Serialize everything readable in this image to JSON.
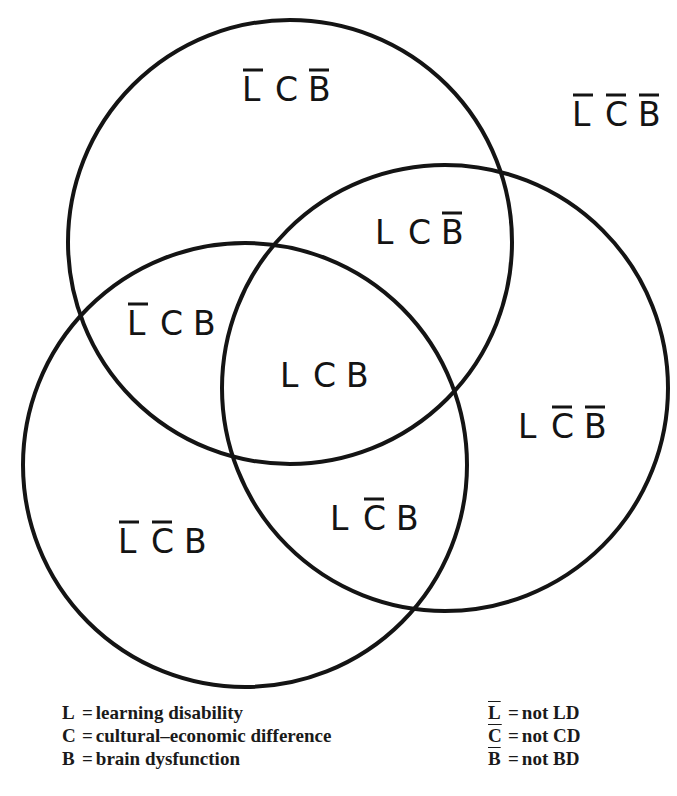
{
  "diagram": {
    "type": "venn",
    "stroke_color": "#141414",
    "background": "#ffffff",
    "circles": [
      {
        "id": "top",
        "cx": 290,
        "cy": 242,
        "r": 222
      },
      {
        "id": "right",
        "cx": 445,
        "cy": 388,
        "r": 223
      },
      {
        "id": "bottom-left",
        "cx": 245,
        "cy": 465,
        "r": 222
      }
    ],
    "regions": [
      {
        "id": "outside",
        "label": "L̄C̄B̄",
        "letters": [
          {
            "ch": "L",
            "bar": true
          },
          {
            "ch": "C",
            "bar": true
          },
          {
            "ch": "B",
            "bar": true
          }
        ],
        "x": 572,
        "y": 126
      },
      {
        "id": "top-only",
        "label": "L̄CB̄",
        "letters": [
          {
            "ch": "L",
            "bar": true
          },
          {
            "ch": "C",
            "bar": false
          },
          {
            "ch": "B",
            "bar": true
          }
        ],
        "x": 242,
        "y": 101
      },
      {
        "id": "top-right",
        "label": "LCB̄",
        "letters": [
          {
            "ch": "L",
            "bar": false
          },
          {
            "ch": "C",
            "bar": false
          },
          {
            "ch": "B",
            "bar": true
          }
        ],
        "x": 375,
        "y": 244
      },
      {
        "id": "top-left",
        "label": "L̄CB",
        "letters": [
          {
            "ch": "L",
            "bar": true
          },
          {
            "ch": "C",
            "bar": false
          },
          {
            "ch": "B",
            "bar": false
          }
        ],
        "x": 127,
        "y": 335
      },
      {
        "id": "center",
        "label": "LCB",
        "letters": [
          {
            "ch": "L",
            "bar": false
          },
          {
            "ch": "C",
            "bar": false
          },
          {
            "ch": "B",
            "bar": false
          }
        ],
        "x": 280,
        "y": 387
      },
      {
        "id": "right-only",
        "label": "LC̄B̄",
        "letters": [
          {
            "ch": "L",
            "bar": false
          },
          {
            "ch": "C",
            "bar": true
          },
          {
            "ch": "B",
            "bar": true
          }
        ],
        "x": 518,
        "y": 438
      },
      {
        "id": "bottom-right",
        "label": "LC̄B",
        "letters": [
          {
            "ch": "L",
            "bar": false
          },
          {
            "ch": "C",
            "bar": true
          },
          {
            "ch": "B",
            "bar": false
          }
        ],
        "x": 330,
        "y": 530
      },
      {
        "id": "bottom-left-only",
        "label": "L̄C̄B",
        "letters": [
          {
            "ch": "L",
            "bar": true
          },
          {
            "ch": "C",
            "bar": true
          },
          {
            "ch": "B",
            "bar": false
          }
        ],
        "x": 118,
        "y": 553
      }
    ]
  },
  "legend": {
    "left": [
      {
        "key": "L",
        "eq": "=",
        "text": "learning disability"
      },
      {
        "key": "C",
        "eq": "=",
        "text": "cultural–economic difference"
      },
      {
        "key": "B",
        "eq": "=",
        "text": "brain dysfunction"
      }
    ],
    "right": [
      {
        "key": "L",
        "overline": true,
        "eq": "=",
        "text": "not LD"
      },
      {
        "key": "C",
        "overline": true,
        "eq": "=",
        "text": "not CD"
      },
      {
        "key": "B",
        "overline": true,
        "eq": "=",
        "text": "not BD"
      }
    ]
  }
}
